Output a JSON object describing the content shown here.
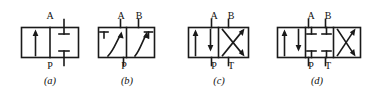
{
  "figure": {
    "stroke_color": "#1a1a1a",
    "background": "#ffffff"
  },
  "diagrams": [
    {
      "id": "valve-a",
      "caption": "(a)",
      "positions": 2,
      "description": "two-position two-way valve: left square straight-through arrow, right square blocked ports",
      "top_ports": [
        {
          "name": "A"
        }
      ],
      "bottom_ports": [
        {
          "name": "P"
        }
      ],
      "cells": [
        {
          "index": 0,
          "symbol": "straight-arrow-up"
        },
        {
          "index": 1,
          "symbol": "blocked-ports"
        }
      ]
    },
    {
      "id": "valve-b",
      "caption": "(b)",
      "positions": 2,
      "description": "two-position three-way valve: curved diagonal flow arrows with blocked port stubs",
      "top_ports": [
        {
          "name": "A"
        },
        {
          "name": "B"
        }
      ],
      "bottom_ports": [
        {
          "name": "P"
        }
      ],
      "cells": [
        {
          "index": 0,
          "symbol": "curved-arrow-blocked"
        },
        {
          "index": 1,
          "symbol": "curved-arrow-blocked"
        }
      ]
    },
    {
      "id": "valve-c",
      "caption": "(c)",
      "positions": 2,
      "description": "two-position four-way valve: parallel arrows square and crossed arrows square",
      "top_ports": [
        {
          "name": "A"
        },
        {
          "name": "B"
        }
      ],
      "bottom_ports": [
        {
          "name": "P"
        },
        {
          "name": "T"
        }
      ],
      "cells": [
        {
          "index": 0,
          "symbol": "parallel-arrows"
        },
        {
          "index": 1,
          "symbol": "crossed-arrows"
        }
      ]
    },
    {
      "id": "valve-d",
      "caption": "(d)",
      "positions": 3,
      "description": "three-position four-way valve: parallel arrows, closed-centre blocked ports, crossed arrows",
      "top_ports": [
        {
          "name": "A"
        },
        {
          "name": "B"
        }
      ],
      "bottom_ports": [
        {
          "name": "P"
        },
        {
          "name": "T"
        }
      ],
      "cells": [
        {
          "index": 0,
          "symbol": "parallel-arrows"
        },
        {
          "index": 1,
          "symbol": "blocked-ports-closed-centre"
        },
        {
          "index": 2,
          "symbol": "crossed-arrows"
        }
      ]
    }
  ]
}
